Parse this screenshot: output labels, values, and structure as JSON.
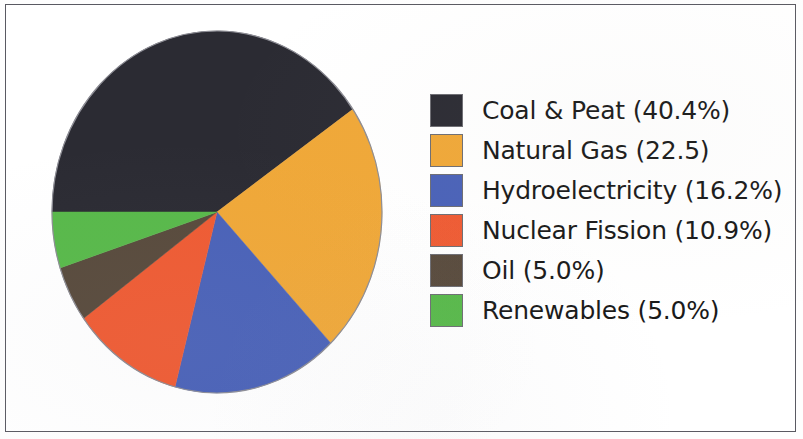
{
  "chart_data": {
    "type": "pie",
    "title": "",
    "subtitle": "",
    "xlabel": "",
    "ylabel": "",
    "legend_position": "right",
    "grid": false,
    "start_angle_deg": 180,
    "direction": "clockwise",
    "categories": [
      "Coal & Peat",
      "Natural Gas",
      "Hydroelectricity",
      "Nuclear Fission",
      "Oil",
      "Renewables"
    ],
    "values": [
      40.4,
      22.5,
      16.2,
      10.9,
      5.0,
      5.0
    ],
    "colors": [
      "#2b2b33",
      "#f0a838",
      "#4a62b8",
      "#ef5b33",
      "#584a3c",
      "#58b94a"
    ],
    "slices": [
      {
        "label": "Coal & Peat",
        "value": 40.4,
        "legend_text": "Coal & Peat (40.4%)",
        "color": "#2b2b33"
      },
      {
        "label": "Natural Gas",
        "value": 22.5,
        "legend_text": "Natural Gas (22.5)",
        "color": "#f0a838"
      },
      {
        "label": "Hydroelectricity",
        "value": 16.2,
        "legend_text": "Hydroelectricity (16.2%)",
        "color": "#4a62b8"
      },
      {
        "label": "Nuclear Fission",
        "value": 10.9,
        "legend_text": "Nuclear Fission (10.9%)",
        "color": "#ef5b33"
      },
      {
        "label": "Oil",
        "value": 5.0,
        "legend_text": "Oil (5.0%)",
        "color": "#584a3c"
      },
      {
        "label": "Renewables",
        "value": 5.0,
        "legend_text": "Renewables (5.0%)",
        "color": "#58b94a"
      }
    ]
  },
  "legend": {
    "items": [
      {
        "text": "Coal & Peat (40.4%)",
        "color": "#2b2b33"
      },
      {
        "text": "Natural Gas (22.5)",
        "color": "#f0a838"
      },
      {
        "text": "Hydroelectricity (16.2%)",
        "color": "#4a62b8"
      },
      {
        "text": "Nuclear Fission (10.9%)",
        "color": "#ef5b33"
      },
      {
        "text": "Oil (5.0%)",
        "color": "#584a3c"
      },
      {
        "text": "Renewables (5.0%)",
        "color": "#58b94a"
      }
    ]
  }
}
